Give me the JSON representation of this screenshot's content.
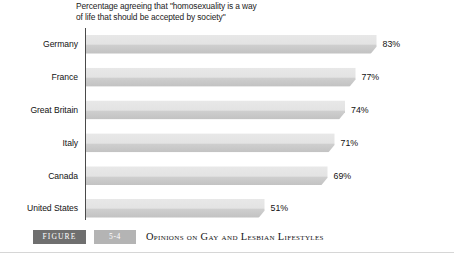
{
  "chart_data": {
    "type": "bar",
    "orientation": "horizontal",
    "title": "Percentage agreeing that \"homosexuality is a way\nof life that should be accepted by society\"",
    "xlabel": "",
    "ylabel": "",
    "xlim": [
      0,
      100
    ],
    "grid": false,
    "legend": false,
    "categories": [
      "Germany",
      "France",
      "Great Britain",
      "Italy",
      "Canada",
      "United States"
    ],
    "values": [
      83,
      77,
      74,
      71,
      69,
      51
    ],
    "value_labels": [
      "83%",
      "77%",
      "74%",
      "71%",
      "69%",
      "51%"
    ],
    "bars": [
      {
        "category": "Germany",
        "value": 83,
        "label": "83%"
      },
      {
        "category": "France",
        "value": 77,
        "label": "77%"
      },
      {
        "category": "Great Britain",
        "value": 74,
        "label": "74%"
      },
      {
        "category": "Italy",
        "value": 71,
        "label": "71%"
      },
      {
        "category": "Canada",
        "value": 69,
        "label": "69%"
      },
      {
        "category": "United States",
        "value": 51,
        "label": "51%"
      }
    ],
    "colors": {
      "bar_top": "#e8e8e8",
      "bar_bottom": "#c2c2c2",
      "axis": "#4a4a4a",
      "text": "#121212"
    }
  },
  "caption": {
    "figure_label": "FIGURE",
    "figure_number": "5-4",
    "title": "Opinions on Gay and Lesbian Lifestyles"
  }
}
